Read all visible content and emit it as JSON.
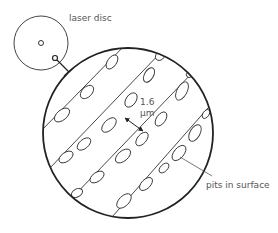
{
  "labels": {
    "disc": "laser disc",
    "pits": "pits in surface",
    "distance_value": "1.6",
    "distance_unit": "μm"
  },
  "colors": {
    "stroke": "#333333",
    "text": "#555555",
    "background": "#ffffff"
  },
  "icons": {
    "disc": "small-disc-circle",
    "magnified": "magnified-circle",
    "arrow": "double-headed-arrow"
  }
}
